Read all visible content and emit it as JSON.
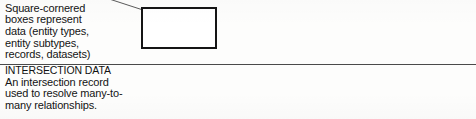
{
  "legend": {
    "entries": [
      {
        "id": "data",
        "heading": "DATA",
        "body_lines": [
          "Square-cornered",
          "boxes represent",
          "data (entity types,",
          "entity subtypes,",
          "records, datasets)"
        ],
        "symbol": "rectangle",
        "symbol_name": "square-cornered-box-symbol",
        "has_leader_line": true
      },
      {
        "id": "intersection",
        "heading": "INTERSECTION DATA",
        "body_lines": [
          "An intersection record",
          "used to resolve many-to-",
          "many relationships."
        ],
        "symbol": "diamond-in-box",
        "symbol_name": "intersection-diamond-symbol",
        "has_leader_line": false
      }
    ]
  },
  "style": {
    "ink_color": "#151515",
    "rule_color": "#4a4a4a",
    "leader_color": "#5a5a5a",
    "page_color": "#fdfdfc"
  }
}
